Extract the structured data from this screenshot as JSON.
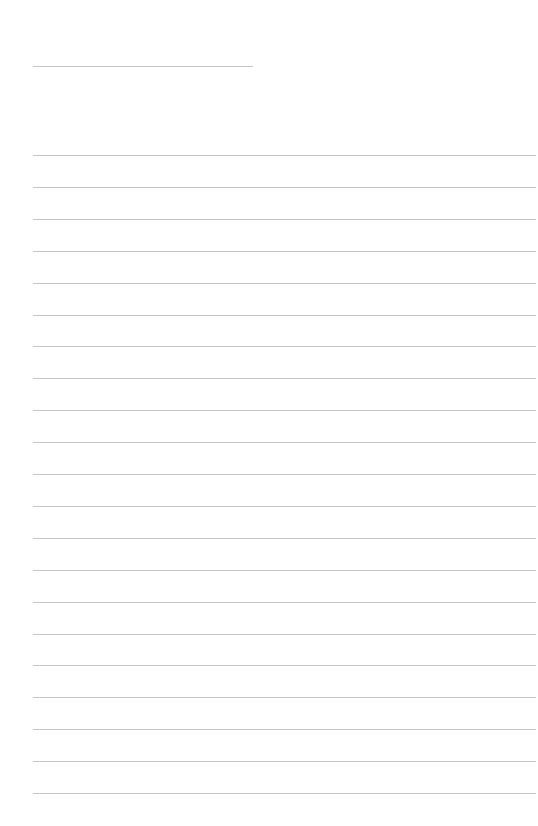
{
  "page": {
    "type": "lined-paper",
    "line_color": "#c4c4c4",
    "background": "#ffffff",
    "title_line": {
      "x": 33,
      "y": 66,
      "width": 220
    },
    "ruled_lines": {
      "x": 33,
      "width": 503,
      "start_y": 155,
      "spacing": 31.9,
      "count": 21
    }
  }
}
